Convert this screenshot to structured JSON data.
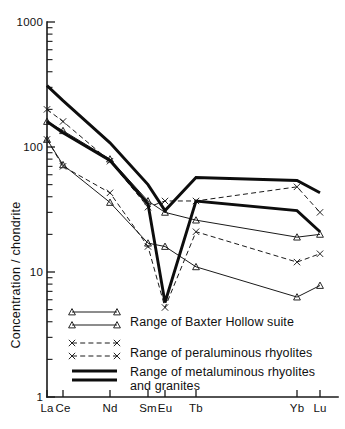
{
  "chart_data": {
    "type": "line",
    "title": "",
    "xlabel": "",
    "ylabel": "Concentration / chondrite",
    "x_categories": [
      "La",
      "Ce",
      "Nd",
      "Sm",
      "Eu",
      "Tb",
      "Yb",
      "Lu"
    ],
    "x_tick_labels": [
      "La",
      "Ce",
      "Nd",
      "Sm",
      "Eu",
      "Tb",
      "Yb",
      "Lu"
    ],
    "y_scale": "log",
    "ylim": [
      1,
      1000
    ],
    "y_tick_labels": [
      "1000",
      "100",
      "10",
      "1"
    ],
    "y_tick_values": [
      1000,
      100,
      10,
      1
    ],
    "grid": false,
    "legend_position": "inside-bottom-left",
    "series": [
      {
        "name": "Baxter Hollow suite - upper bound",
        "group": "Range of Baxter Hollow suite",
        "style": "thin-solid",
        "marker": "triangle",
        "x": [
          "La",
          "Ce",
          "Nd",
          "Sm",
          "Eu",
          "Tb",
          "Yb",
          "Lu"
        ],
        "values": [
          160,
          135,
          80,
          37,
          30,
          26,
          19,
          20
        ]
      },
      {
        "name": "Baxter Hollow suite - lower bound",
        "group": "Range of Baxter Hollow suite",
        "style": "thin-solid",
        "marker": "triangle",
        "x": [
          "La",
          "Ce",
          "Nd",
          "Sm",
          "Eu",
          "Tb",
          "Yb",
          "Lu"
        ],
        "values": [
          115,
          72,
          36,
          17,
          16,
          11,
          6.3,
          7.8
        ]
      },
      {
        "name": "Peraluminous rhyolites - upper bound",
        "group": "Range of peraluminous rhyolites",
        "style": "thin-dashed",
        "marker": "x",
        "x": [
          "La",
          "Ce",
          "Nd",
          "Sm",
          "Eu",
          "Tb",
          "Yb",
          "Lu"
        ],
        "values": [
          200,
          160,
          77,
          33,
          37,
          37,
          48,
          30
        ]
      },
      {
        "name": "Peraluminous rhyolites - lower bound",
        "group": "Range of peraluminous rhyolites",
        "style": "thin-dashed",
        "marker": "x",
        "x": [
          "La",
          "Ce",
          "Nd",
          "Sm",
          "Eu",
          "Tb",
          "Yb",
          "Lu"
        ],
        "values": [
          115,
          70,
          43,
          16,
          5.2,
          21,
          12,
          14
        ]
      },
      {
        "name": "Metaluminous rhyolites and granites - upper bound",
        "group": "Range of metaluminous rhyolites and granites",
        "style": "thick-solid",
        "marker": "none",
        "x": [
          "La",
          "Ce",
          "Nd",
          "Sm",
          "Eu",
          "Tb",
          "Yb",
          "Lu"
        ],
        "values": [
          310,
          235,
          108,
          50,
          31,
          57,
          54,
          43
        ]
      },
      {
        "name": "Metaluminous rhyolites and granites - lower bound",
        "group": "Range of metaluminous rhyolites and granites",
        "style": "thick-solid",
        "marker": "none",
        "x": [
          "La",
          "Ce",
          "Nd",
          "Sm",
          "Eu",
          "Tb",
          "Yb",
          "Lu"
        ],
        "values": [
          160,
          130,
          78,
          35,
          5.7,
          37,
          31,
          21
        ]
      }
    ],
    "legend": [
      {
        "label": "Range of Baxter Hollow suite",
        "style": "thin-solid",
        "marker": "triangle"
      },
      {
        "label": "Range of peraluminous rhyolites",
        "style": "thin-dashed",
        "marker": "x"
      },
      {
        "label": "Range of metaluminous rhyolites",
        "label_line2": "and granites",
        "style": "thick-solid",
        "marker": "none"
      }
    ],
    "colors": {
      "line": "#1a1a1a",
      "axis": "#1a1a1a",
      "background": "#ffffff"
    }
  }
}
